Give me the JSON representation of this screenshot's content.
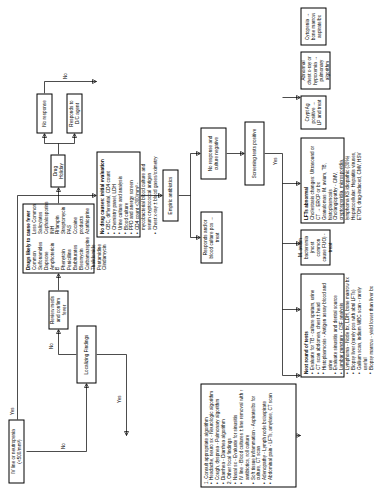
{
  "diagram": {
    "nodes": {
      "iv_line": "IV line or neutropenia (<500/mm³)",
      "localizing": "Localizing Findings",
      "review_meds": "Review meds and confirm fever",
      "drug_holiday": "Drug Holiday",
      "responds_dc": "Responds to D/C agent",
      "no_response": "No response",
      "empiric_abx": "Empiric antibiotics",
      "responds_blood_pos": "Responds and/or blood culture pos → treat",
      "no_response_cx_neg": "No response and culture negative",
      "screening_positive": "Screening tests positive",
      "crypt_ag": "Crypt Ag positive → LP and treat",
      "abnormal_cxr": "Abnormal chest x-ray or hypoxemia → pulmonary algorithm",
      "cytopenia": "Cytopenia → bone marrow aspirate/bx"
    },
    "edge_labels": {
      "yes_top": "Yes",
      "no_iv": "No",
      "no_localizing": "No",
      "yes_localizing": "Yes",
      "no_drugs": "No",
      "yes_screen": "Yes"
    },
    "initial_eval": {
      "title": "No drug causes: initial evaluation",
      "items": [
        "CBC, differential, CD4 count",
        "Chemistry panel, LDH",
        "Urine culture and analysis",
        "Blood culture",
        "PPD and anergy screen",
        "CD4 count <300/mm³ - mycobacterial blood culture and serum cryptococcal antigen",
        "Chest x-ray ± blood gases/oximetry"
      ]
    },
    "drugs": {
      "title": "Drugs likely to cause fever",
      "col1_header": "Common",
      "col2_header": "Less Common",
      "col1": [
        "Sulfonamides",
        "Dapsone",
        "Amphotericin B",
        "Phenytoin",
        "Penicillins",
        "Barbiturates",
        "Bleomycin",
        "Carbamazepine",
        "Thalidomide",
        "Pentamidine",
        "Clindamycin"
      ],
      "col2": [
        "Salicylates",
        "Cephalosporins",
        "INH",
        "Rifampin",
        "Streptomycin",
        "PAS",
        "Cocaine products",
        "Azathioprine"
      ]
    },
    "localizing_box": {
      "step1": "1. Consult appropriate algorithm",
      "step1_items": [
        "Headache, neuro sx - Neurologic algorithm",
        "Cough, dyspnea - Pulmonary algorithm",
        "Diarrhea - Diarrhea algorithm"
      ],
      "step2": "2. Other focal findings",
      "step2_items": [
        "Nasal sx - Evaluate for sinusitis",
        "IV line - Blood cultures ± line removal with ↑ antibiotics, roll culture",
        "Soft tissue inflammation - Aspirate/bx for culture, CT scan",
        "Adenopathy - Lymph node bx/aspirate",
        "Abdominal pain - LFTs, amylase, CT scan"
      ]
    },
    "next_tests": {
      "title": "Next round of tests",
      "items": [
        "Evaluate for TB - culture sputum, urine",
        "CT scan abdomen, chest ± head",
        "Histoplasmosis - Antigen assay blood and urine",
        "Evaluate sinusitis and dental source",
        "Lumbar puncture - CSF analysis",
        "Lymphoma - Node bx, LDH, bone marrow bx",
        "Biopsy liver (rarely pos with abnl LFTs)",
        "Gallium scan, indium WBC scan - rarely useful",
        "Biopsy marrow - yield lower than liver bx"
      ]
    },
    "lft_box": {
      "title": "LFTs abnormal",
      "items": [
        "Cholestasis changes: Ultrasound or CT → ERCP or bx",
        "Granulomas: M. avium, TB, histoplasmosis",
        "Cholangiopathy - CMV, cryptosporidia, microsporidia, lymphoma KS idiopathic (30%)",
        "Hepatocellular: Hepatitis viruses, ETOH, drug-induced, CMV, HSV"
      ]
    },
    "serum_box": {
      "title": "M. avium bacteremia (most common cause FUO) - treat",
      "items": []
    }
  }
}
